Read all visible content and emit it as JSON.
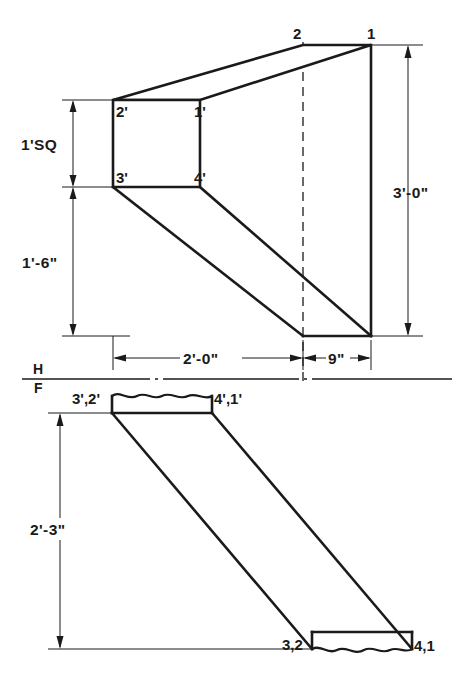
{
  "drawing": {
    "title": "Orthographic Projection of Inclined Prism",
    "background_color": "#ffffff",
    "line_color": "#1a1a1a"
  },
  "front_view": {
    "name": "front-view",
    "vertex_labels": {
      "top_front_right": "1",
      "top_front_left": "2",
      "square_top_left": "2'",
      "square_top_right": "1'",
      "square_bottom_left": "3'",
      "square_bottom_right": "4'"
    },
    "dimensions": {
      "square_size": "1'SQ",
      "lower_height": "1'-6\"",
      "total_height": "3'-0\"",
      "horizontal_run": "2'-0\"",
      "end_width": "9\""
    }
  },
  "reference_line": {
    "name": "hf-reference-line",
    "upper_label": "H",
    "lower_label": "F"
  },
  "top_view": {
    "name": "top-view",
    "vertex_labels": {
      "upper_left": "3',2'",
      "upper_right": "4',1'",
      "lower_left": "3,2",
      "lower_right": "4,1"
    },
    "dimensions": {
      "depth": "2'-3\""
    }
  }
}
